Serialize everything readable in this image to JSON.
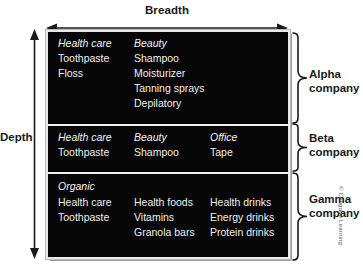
{
  "axes": {
    "breadth_label": "Breadth",
    "depth_label": "Depth"
  },
  "matrix": {
    "sections": [
      {
        "company": "Alpha",
        "company_line2": "company",
        "columns": [
          {
            "category": "Health care",
            "items": [
              "Toothpaste",
              "Floss"
            ]
          },
          {
            "category": "Beauty",
            "items": [
              "Shampoo",
              "Moisturizer",
              "Tanning sprays",
              "Depilatory"
            ]
          }
        ]
      },
      {
        "company": "Beta",
        "company_line2": "company",
        "columns": [
          {
            "category": "Health care",
            "items": [
              "Toothpaste"
            ]
          },
          {
            "category": "Beauty",
            "items": [
              "Shampoo"
            ]
          },
          {
            "category": "Office",
            "items": [
              "Tape"
            ]
          }
        ]
      },
      {
        "company": "Gamma",
        "company_line2": "company",
        "group_header": "Organic",
        "columns": [
          {
            "category": "",
            "items": [
              "Health care",
              "Toothpaste"
            ]
          },
          {
            "category": "",
            "items": [
              "Health foods",
              "Vitamins",
              "Granola bars"
            ]
          },
          {
            "category": "",
            "items": [
              "Health drinks",
              "Energy drinks",
              "Protein drinks"
            ]
          }
        ]
      }
    ]
  },
  "credit": "© Cengage Learning",
  "colors": {
    "box_fill": "#050505",
    "box_border": "#e9e9e9",
    "text_on_dark": "#efefef",
    "text_on_light": "#1a1a1a"
  }
}
